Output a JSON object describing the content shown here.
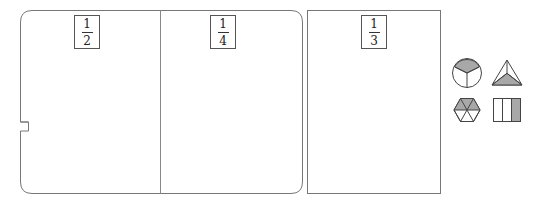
{
  "canvas": {
    "width": 535,
    "height": 204,
    "background": "#ffffff"
  },
  "colors": {
    "stroke": "#555555",
    "card_stroke": "#777777",
    "shade_fill": "#a8a8a8",
    "white_fill": "#ffffff",
    "text": "#222222"
  },
  "cards": [
    {
      "id": "card-half",
      "name": "fraction-card-one-half",
      "x": 20,
      "y": 10,
      "width": 283,
      "height": 184,
      "corner_style": "rounded",
      "has_left_notch": true,
      "notch": {
        "x": 20,
        "y": 122,
        "depth": 8,
        "height": 8
      },
      "spine_x": 160
    },
    {
      "id": "card-third",
      "name": "fraction-card-one-third",
      "x": 307,
      "y": 10,
      "width": 134,
      "height": 184,
      "corner_style": "square",
      "has_left_notch": false
    }
  ],
  "fraction_labels": [
    {
      "id": "frac-half",
      "name": "fraction-label-one-half",
      "numerator": "1",
      "denominator": "2",
      "x": 74,
      "y": 15,
      "width": 26,
      "height": 34
    },
    {
      "id": "frac-quarter",
      "name": "fraction-label-one-quarter",
      "numerator": "1",
      "denominator": "4",
      "x": 210,
      "y": 15,
      "width": 26,
      "height": 34
    },
    {
      "id": "frac-third",
      "name": "fraction-label-one-third",
      "numerator": "1",
      "denominator": "3",
      "x": 361,
      "y": 15,
      "width": 26,
      "height": 34
    }
  ],
  "shape_palette": {
    "name": "shape-palette",
    "x": 450,
    "y": 56,
    "columns": 2,
    "rows": 2,
    "tiles": [
      {
        "id": "tile-circle-thirds",
        "name": "circle-thirds-shape-icon",
        "shape": "circle",
        "x": 452,
        "y": 58,
        "size": 30,
        "partitions": 3,
        "shaded_parts": 1,
        "shaded_label": "top sector shaded",
        "fraction": "1/3"
      },
      {
        "id": "tile-triangle-thirds",
        "name": "triangle-thirds-shape-icon",
        "shape": "triangle",
        "x": 490,
        "y": 58,
        "size": 32,
        "partitions": 3,
        "shaded_parts": 1,
        "shaded_label": "bottom sub-triangle shaded",
        "fraction": "1/3"
      },
      {
        "id": "tile-hexagon-sixths",
        "name": "hexagon-sixths-shape-icon",
        "shape": "hexagon",
        "x": 452,
        "y": 94,
        "size": 30,
        "partitions": 6,
        "shaded_parts": 3,
        "shaded_label": "upper half shaded",
        "fraction": "1/2"
      },
      {
        "id": "tile-rectangle-thirds",
        "name": "rectangle-thirds-shape-icon",
        "shape": "rectangle",
        "x": 492,
        "y": 95,
        "size": 28,
        "partitions": 3,
        "shaded_parts": 1,
        "shaded_label": "right strip shaded",
        "fraction": "1/3"
      }
    ]
  }
}
